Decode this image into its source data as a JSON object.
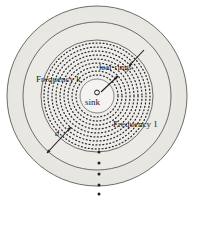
{
  "figure": {
    "type": "diagram",
    "kind": "concentric-ring-network-diagram",
    "title": "",
    "background_color": "#ffffff",
    "band_fill_color": "#e8e6e1",
    "ring_stroke_color": "#58585a",
    "dotted_ring_color": "#2b2b2b",
    "label_color": "#1a1a1a",
    "center": {
      "x": 97,
      "y": 96
    },
    "sink": {
      "label": "sink",
      "marker": "small-open-circle",
      "marker_radius_px": 2.5,
      "position": {
        "x": 97,
        "y": 93
      }
    },
    "solid_rings": [
      {
        "name": "inner-core-boundary",
        "radius_px": 17
      },
      {
        "name": "dotted-band-outer-boundary",
        "radius_px": 56
      },
      {
        "name": "mid-band-boundary",
        "radius_px": 74
      },
      {
        "name": "outer-band-boundary",
        "radius_px": 90
      }
    ],
    "dotted_rings": {
      "count": 9,
      "inner_radius_px": 21,
      "outer_radius_px": 53,
      "spacing_px": 4,
      "dash": "1px dot",
      "description": "nested dotted concentric rings between the core and the first solid band"
    },
    "ellipsis": {
      "name": "vertical-dot-ellipsis",
      "dot_count": 5,
      "x_px": 99,
      "y_start_px": 150,
      "y_end_px": 194,
      "meaning": "more rings continue outward"
    },
    "annotations": [
      {
        "id": "freq-k",
        "text": "Frequency k",
        "arrow": "points-right-up-to-inner-dotted-rings",
        "arrow_from": {
          "x": 100,
          "y": 92
        },
        "arrow_to": {
          "x": 118,
          "y": 77
        }
      },
      {
        "id": "freq-1",
        "text": "Frequency 1",
        "arrow": "none-label-sits-on-outer-dotted-rings",
        "arrow_from": null,
        "arrow_to": null
      },
      {
        "id": "leaf-rings",
        "text": "leaf-rings",
        "arrow": "points-left-down-to-outermost-dotted-ring",
        "arrow_from": {
          "x": 143,
          "y": 51
        },
        "arrow_to": {
          "x": 128,
          "y": 66
        }
      },
      {
        "id": "ring-width-d",
        "text": "d",
        "arrow": "double-headed",
        "arrow_from": {
          "x": 48,
          "y": 152
        },
        "arrow_to": {
          "x": 70,
          "y": 128
        },
        "meaning": "width of one ring band"
      }
    ],
    "bleed_through_text": {
      "line_1": "",
      "line_2": "",
      "line_3": ""
    }
  }
}
